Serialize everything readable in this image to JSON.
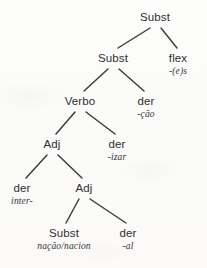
{
  "figure": {
    "kind": "morphological-derivation-tree",
    "language": "Portuguese",
    "background_color": "#fcfcfb",
    "edge_color": "#3a3a3a",
    "text_color": "#2e2e2e"
  },
  "nodes": [
    {
      "id": "n0",
      "category": "Subst",
      "morph": "",
      "x": 155,
      "y": 12,
      "name": "node-root-subst"
    },
    {
      "id": "n1",
      "category": "Subst",
      "morph": "",
      "x": 113,
      "y": 53,
      "name": "node-subst-level2"
    },
    {
      "id": "n2",
      "category": "flex",
      "morph": "-(e)s",
      "x": 178,
      "y": 53,
      "name": "node-flex-es"
    },
    {
      "id": "n3",
      "category": "Verbo",
      "morph": "",
      "x": 80,
      "y": 96,
      "name": "node-verbo"
    },
    {
      "id": "n4",
      "category": "der",
      "morph": "-ção",
      "x": 146,
      "y": 96,
      "name": "node-der-cao"
    },
    {
      "id": "n5",
      "category": "Adj",
      "morph": "",
      "x": 52,
      "y": 139,
      "name": "node-adj-level4"
    },
    {
      "id": "n6",
      "category": "der",
      "morph": "-izar",
      "x": 117,
      "y": 139,
      "name": "node-der-izar"
    },
    {
      "id": "n7",
      "category": "der",
      "morph": "inter-",
      "x": 22,
      "y": 183,
      "name": "node-der-inter"
    },
    {
      "id": "n8",
      "category": "Adj",
      "morph": "",
      "x": 84,
      "y": 183,
      "name": "node-adj-level5"
    },
    {
      "id": "n9",
      "category": "Subst",
      "morph": "nação/nacion",
      "x": 64,
      "y": 228,
      "name": "node-subst-nacao"
    },
    {
      "id": "n10",
      "category": "der",
      "morph": "-al",
      "x": 128,
      "y": 228,
      "name": "node-der-al"
    }
  ],
  "edges": [
    {
      "from": "n0",
      "to": "n1",
      "x1": 150,
      "y1": 28,
      "x2": 118,
      "y2": 48,
      "name": "edge-root-to-subst"
    },
    {
      "from": "n0",
      "to": "n2",
      "x1": 161,
      "y1": 28,
      "x2": 177,
      "y2": 48,
      "name": "edge-root-to-flex"
    },
    {
      "from": "n1",
      "to": "n3",
      "x1": 108,
      "y1": 69,
      "x2": 84,
      "y2": 91,
      "name": "edge-subst-to-verbo"
    },
    {
      "from": "n1",
      "to": "n4",
      "x1": 119,
      "y1": 69,
      "x2": 144,
      "y2": 91,
      "name": "edge-subst-to-der-cao"
    },
    {
      "from": "n3",
      "to": "n5",
      "x1": 75,
      "y1": 112,
      "x2": 56,
      "y2": 134,
      "name": "edge-verbo-to-adj"
    },
    {
      "from": "n3",
      "to": "n6",
      "x1": 86,
      "y1": 112,
      "x2": 115,
      "y2": 134,
      "name": "edge-verbo-to-der-izar"
    },
    {
      "from": "n5",
      "to": "n7",
      "x1": 47,
      "y1": 155,
      "x2": 26,
      "y2": 178,
      "name": "edge-adj-to-der-inter"
    },
    {
      "from": "n5",
      "to": "n8",
      "x1": 58,
      "y1": 155,
      "x2": 82,
      "y2": 178,
      "name": "edge-adj-to-adj"
    },
    {
      "from": "n8",
      "to": "n9",
      "x1": 79,
      "y1": 199,
      "x2": 66,
      "y2": 223,
      "name": "edge-adj-to-subst-nacao"
    },
    {
      "from": "n8",
      "to": "n10",
      "x1": 90,
      "y1": 199,
      "x2": 126,
      "y2": 223,
      "name": "edge-adj-to-der-al"
    }
  ]
}
